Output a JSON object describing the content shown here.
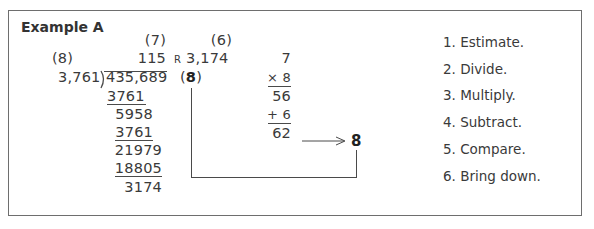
{
  "title": "Example A",
  "division": {
    "estimates": {
      "quotient_est": "(7)",
      "remainder_est": "(6)",
      "divisor_est": "(8)",
      "check_digit": "8"
    },
    "quotient": "115",
    "remainder_label": "R",
    "remainder": "3,174",
    "divisor": "3,761",
    "dividend": "435,689",
    "work_rows": [
      {
        "value": "3761",
        "underlined": true
      },
      {
        "value": "5958",
        "underlined": false
      },
      {
        "value": "3761",
        "underlined": true
      },
      {
        "value": "21979",
        "underlined": false
      },
      {
        "value": "18805",
        "underlined": true
      },
      {
        "value": "3174",
        "underlined": false
      }
    ]
  },
  "check": {
    "rows": [
      "7",
      "× 8",
      "56",
      "+ 6",
      "62"
    ],
    "result": "8",
    "paren_open": "(",
    "paren_close": ")"
  },
  "steps": [
    "1. Estimate.",
    "2. Divide.",
    "3. Multiply.",
    "4. Subtract.",
    "5. Compare.",
    "6. Bring down."
  ]
}
